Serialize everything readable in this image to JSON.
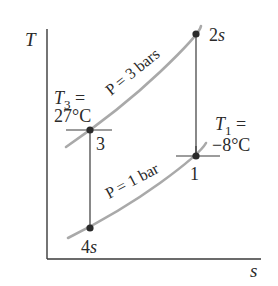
{
  "diagram": {
    "type": "T-s diagram",
    "axes": {
      "y_label": "T",
      "x_label": "s"
    },
    "isobars": [
      {
        "id": "high",
        "label": "P = 3 bars",
        "color": "#a9a9a9"
      },
      {
        "id": "low",
        "label": "P = 1 bar",
        "color": "#a9a9a9"
      }
    ],
    "states": [
      {
        "id": "1",
        "label": "1"
      },
      {
        "id": "2s",
        "label_num": "2",
        "label_sub": "s"
      },
      {
        "id": "3",
        "label": "3"
      },
      {
        "id": "4s",
        "label_num": "4",
        "label_sub": "s"
      }
    ],
    "annotations": {
      "t3": {
        "symbol": "T",
        "subscript": "3",
        "eq": " =",
        "value": "27°C"
      },
      "t1": {
        "symbol": "T",
        "subscript": "1",
        "eq": " =",
        "value": "−8°C"
      }
    },
    "colors": {
      "axis": "#3a3a3a",
      "curve": "#a9a9a9",
      "point": "#2a2a2a",
      "text": "#2a2a2a"
    }
  }
}
